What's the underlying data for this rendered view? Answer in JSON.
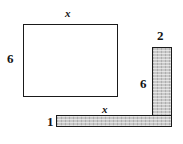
{
  "figure": {
    "background_color": "#ffffff",
    "stroke_color": "#1a1a1a",
    "fill_color": "#c9c9c9",
    "shapes": [
      {
        "id": "rectangle",
        "name": "open-rectangle",
        "filled": false,
        "x": 23,
        "y": 24,
        "width": 95,
        "height": 73
      },
      {
        "id": "vertical-bar",
        "name": "vertical-shaded-bar",
        "filled": true,
        "x": 152,
        "y": 47,
        "width": 20,
        "height": 80
      },
      {
        "id": "horizontal-bar",
        "name": "horizontal-shaded-bar",
        "filled": true,
        "x": 56,
        "y": 115,
        "width": 116,
        "height": 12
      }
    ],
    "labels": {
      "rect_top": "x",
      "rect_left": "6",
      "vbar_top": "2",
      "vbar_left": "6",
      "hbar_top": "x",
      "hbar_left": "1"
    }
  }
}
